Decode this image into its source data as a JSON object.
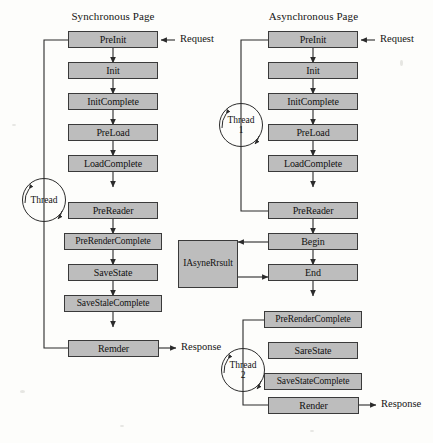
{
  "diagram": {
    "title_left": "Synchronous Page",
    "title_right": "Asynchronous Page",
    "columns": [
      {
        "id": "synchronous",
        "title": "Synchronous Page",
        "nodes": [
          {
            "id": "sync-preinit",
            "label": "PreInit"
          },
          {
            "id": "sync-init",
            "label": "Init"
          },
          {
            "id": "sync-initcomplete",
            "label": "InitComplete"
          },
          {
            "id": "sync-preload",
            "label": "PreLoad"
          },
          {
            "id": "sync-loadcomplete",
            "label": "LoadComplete"
          },
          {
            "id": "sync-prereader",
            "label": "PreReader"
          },
          {
            "id": "sync-prerendercomplete",
            "label": "PreRenderComplete"
          },
          {
            "id": "sync-savestate",
            "label": "SaveState"
          },
          {
            "id": "sync-savestalecomplete",
            "label": "SaveStaleComplete"
          },
          {
            "id": "sync-remder",
            "label": "Remder"
          }
        ],
        "threads": [
          {
            "id": "sync-thread",
            "line1": "Thread",
            "line2": ""
          }
        ],
        "edge_labels": [
          {
            "id": "sync-request",
            "text": "Request"
          },
          {
            "id": "sync-response",
            "text": "Response"
          }
        ]
      },
      {
        "id": "asynchronous",
        "title": "Asynchronous Page",
        "nodes": [
          {
            "id": "async-preinit",
            "label": "PreInit"
          },
          {
            "id": "async-init",
            "label": "Init"
          },
          {
            "id": "async-initcomplete",
            "label": "InitComplete"
          },
          {
            "id": "async-preload",
            "label": "PreLoad"
          },
          {
            "id": "async-loadcomplete",
            "label": "LoadComplete"
          },
          {
            "id": "async-prereader",
            "label": "PreReader"
          },
          {
            "id": "async-begin",
            "label": "Begin"
          },
          {
            "id": "async-end",
            "label": "End"
          },
          {
            "id": "async-prerendercomplete",
            "label": "PreRenderComplete"
          },
          {
            "id": "async-sarestate",
            "label": "SareState"
          },
          {
            "id": "async-savestatecomplete",
            "label": "SaveStateComplete"
          },
          {
            "id": "async-render",
            "label": "Render"
          }
        ],
        "threads": [
          {
            "id": "async-thread-1",
            "line1": "Thread",
            "line2": "1"
          },
          {
            "id": "async-thread-2",
            "line1": "Thread",
            "line2": "2"
          }
        ],
        "edge_labels": [
          {
            "id": "async-request",
            "text": "Request"
          },
          {
            "id": "async-response",
            "text": "Response"
          }
        ]
      }
    ],
    "side_nodes": [
      {
        "id": "iasyncresult",
        "label": "IAsyneRrsult"
      }
    ],
    "colors": {
      "node_fill": "#bdbdbd",
      "node_border": "#3a3a3a",
      "line": "#2b2b2b",
      "background": "#fdfdfb",
      "text": "#111111"
    }
  }
}
